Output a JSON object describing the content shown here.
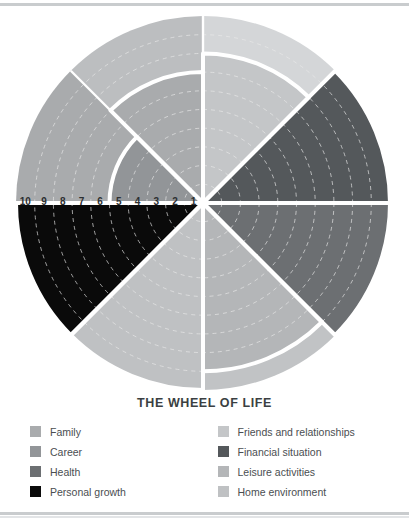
{
  "chart": {
    "title": "THE WHEEL OF LIFE",
    "scale_labels": [
      "10",
      "9",
      "8",
      "7",
      "6",
      "5",
      "4",
      "3",
      "2",
      "1"
    ]
  },
  "legend": {
    "left_column": [
      {
        "label": "Family",
        "color": "#a9abad"
      },
      {
        "label": "Career",
        "color": "#929598"
      },
      {
        "label": "Health",
        "color": "#6c6f72"
      },
      {
        "label": "Personal growth",
        "color": "#0a0a0a"
      }
    ],
    "right_column": [
      {
        "label": "Friends and relationships",
        "color": "#c4c6c8"
      },
      {
        "label": "Financial situation",
        "color": "#54585b"
      },
      {
        "label": "Leisure activities",
        "color": "#b4b6b8"
      },
      {
        "label": "Home environment",
        "color": "#bfc1c3"
      }
    ]
  },
  "chart_data": {
    "type": "pie",
    "title": "THE WHEEL OF LIFE",
    "subtitle": "",
    "xlabel": "",
    "ylabel": "",
    "scale_min": 1,
    "scale_max": 10,
    "radial_axis_labels": [
      "10",
      "9",
      "8",
      "7",
      "6",
      "5",
      "4",
      "3",
      "2",
      "1"
    ],
    "radial_axis_direction": "outer-to-center",
    "grid": true,
    "legend_position": "bottom",
    "ring_count": 10,
    "categories": [
      "Friends and relationships",
      "Financial situation",
      "Health",
      "Leisure activities",
      "Home environment",
      "Personal growth",
      "Career",
      "Family"
    ],
    "values": [
      8,
      10,
      10,
      9,
      10,
      10,
      5,
      7
    ],
    "series": [
      {
        "name": "Score",
        "values": [
          8,
          10,
          10,
          9,
          10,
          10,
          5,
          7
        ]
      }
    ],
    "segments": [
      {
        "name": "Friends and relationships",
        "value": 8,
        "start_angle": 0,
        "end_angle": 45,
        "fill": "#c4c6c8",
        "track": "#d4d6d8"
      },
      {
        "name": "Financial situation",
        "value": 10,
        "start_angle": 45,
        "end_angle": 90,
        "fill": "#54585b",
        "track": "#6d7073"
      },
      {
        "name": "Health",
        "value": 10,
        "start_angle": 90,
        "end_angle": 135,
        "fill": "#6c6f72",
        "track": "#85888b"
      },
      {
        "name": "Leisure activities",
        "value": 9,
        "start_angle": 135,
        "end_angle": 180,
        "fill": "#b4b6b8",
        "track": "#c1c3c5"
      },
      {
        "name": "Home environment",
        "value": 10,
        "start_angle": 180,
        "end_angle": 225,
        "fill": "#bfc1c3",
        "track": "#cacccd"
      },
      {
        "name": "Personal growth",
        "value": 10,
        "start_angle": 225,
        "end_angle": 270,
        "fill": "#0a0a0a",
        "track": "#a9abad"
      },
      {
        "name": "Career",
        "value": 5,
        "start_angle": 270,
        "end_angle": 315,
        "fill": "#929598",
        "track": "#a9abad"
      },
      {
        "name": "Family",
        "value": 7,
        "start_angle": 315,
        "end_angle": 360,
        "fill": "#a9abad",
        "track": "#bcbec0"
      }
    ],
    "colors": {
      "family": "#a9abad",
      "career": "#929598",
      "health": "#6c6f72",
      "personal_growth": "#0a0a0a",
      "friends_and_relationships": "#c4c6c8",
      "financial_situation": "#54585b",
      "leisure_activities": "#b4b6b8",
      "home_environment": "#bfc1c3",
      "separator": "#ffffff",
      "gridline": "#e8e8e8",
      "background": "#ffffff",
      "title_text": "#3b3f42",
      "legend_text": "#4a4e51",
      "frame_rule": "#c9ccce"
    }
  }
}
